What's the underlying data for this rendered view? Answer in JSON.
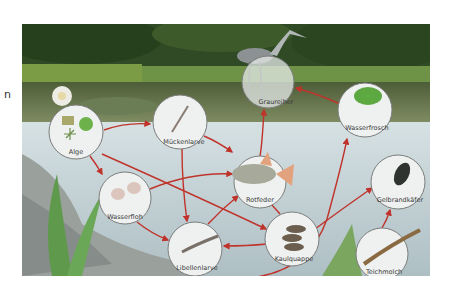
{
  "stray_text": "n",
  "diagram": {
    "type": "food-web",
    "colors": {
      "arrow": "#c0332b",
      "water": "#c7d5d9",
      "water_dark": "#a9bcc2",
      "pond_surface": "#5f6e4a",
      "forest": "#2e4a22",
      "reeds": "#7aa04a",
      "rock": "#9a9f9c",
      "node_fill": "#eef1f0",
      "node_stroke": "#7d7d7d"
    },
    "nodes": [
      {
        "id": "alge",
        "label": "Alge",
        "cx": 54,
        "cy": 108,
        "r": 27
      },
      {
        "id": "wasserfloh",
        "label": "Wasserfloh",
        "cx": 103,
        "cy": 174,
        "r": 26
      },
      {
        "id": "mueckenlarve",
        "label": "Mückenlarve",
        "cx": 158,
        "cy": 98,
        "r": 27
      },
      {
        "id": "rotfeder",
        "label": "Rotfeder",
        "cx": 238,
        "cy": 158,
        "r": 26
      },
      {
        "id": "graureiher",
        "label": "Graureiher",
        "cx": 246,
        "cy": 58,
        "r": 26
      },
      {
        "id": "wasserfrosch",
        "label": "Wasserfrosch",
        "cx": 343,
        "cy": 86,
        "r": 27
      },
      {
        "id": "gelbrandkaefer",
        "label": "Gelbrandkäfer",
        "cx": 376,
        "cy": 158,
        "r": 27
      },
      {
        "id": "libellenlarve",
        "label": "Libellenlarve",
        "cx": 173,
        "cy": 225,
        "r": 27
      },
      {
        "id": "kaulquappe",
        "label": "Kaulquappe",
        "cx": 270,
        "cy": 215,
        "r": 27
      },
      {
        "id": "teichmolch",
        "label": "Teichmolch",
        "cx": 360,
        "cy": 230,
        "r": 26
      }
    ],
    "edges": [
      {
        "from": "Alge",
        "to": "Mückenlarve"
      },
      {
        "from": "Alge",
        "to": "Wasserfloh"
      },
      {
        "from": "Alge",
        "to": "Kaulquappe"
      },
      {
        "from": "Mückenlarve",
        "to": "Rotfeder"
      },
      {
        "from": "Mückenlarve",
        "to": "Libellenlarve"
      },
      {
        "from": "Wasserfloh",
        "to": "Rotfeder"
      },
      {
        "from": "Wasserfloh",
        "to": "Libellenlarve"
      },
      {
        "from": "Libellenlarve",
        "to": "Rotfeder"
      },
      {
        "from": "Libellenlarve",
        "to": "Wasserfrosch"
      },
      {
        "from": "Kaulquappe",
        "to": "Rotfeder"
      },
      {
        "from": "Kaulquappe",
        "to": "Libellenlarve"
      },
      {
        "from": "Kaulquappe",
        "to": "Gelbrandkäfer"
      },
      {
        "from": "Teichmolch",
        "to": "Gelbrandkäfer"
      },
      {
        "from": "Rotfeder",
        "to": "Graureiher"
      },
      {
        "from": "Wasserfrosch",
        "to": "Graureiher"
      }
    ]
  }
}
